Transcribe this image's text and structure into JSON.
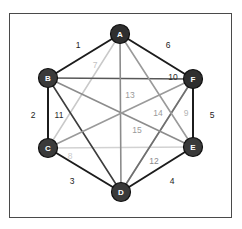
{
  "figure": {
    "title": "",
    "kind": "complete-graph-k6",
    "frame": {
      "stroke": "#4a4a4a",
      "background": "#ffffff"
    }
  },
  "nodes": [
    {
      "id": "A",
      "label": "A",
      "x": 120,
      "y": 34,
      "r": 9.5,
      "fill": "#2f2f2f",
      "text_color": "#ffffff"
    },
    {
      "id": "B",
      "label": "B",
      "x": 48,
      "y": 78,
      "r": 9.5,
      "fill": "#3a3a3a",
      "text_color": "#ffffff"
    },
    {
      "id": "C",
      "label": "C",
      "x": 48,
      "y": 148,
      "r": 9.5,
      "fill": "#3a3a3a",
      "text_color": "#ffffff"
    },
    {
      "id": "D",
      "label": "D",
      "x": 121,
      "y": 192,
      "r": 9.5,
      "fill": "#3a3a3a",
      "text_color": "#ffffff"
    },
    {
      "id": "E",
      "label": "E",
      "x": 193,
      "y": 147,
      "r": 9.5,
      "fill": "#3a3a3a",
      "text_color": "#ffffff"
    },
    {
      "id": "F",
      "label": "F",
      "x": 193,
      "y": 79,
      "r": 9.5,
      "fill": "#2f2f2f",
      "text_color": "#ffffff"
    }
  ],
  "edges": [
    {
      "label": "1",
      "from": "A",
      "to": "B",
      "color": "#1c1c1c",
      "width": 2.0,
      "label_x": 78,
      "label_y": 45,
      "label_color": "#222222"
    },
    {
      "label": "2",
      "from": "B",
      "to": "C",
      "color": "#1c1c1c",
      "width": 2.0,
      "label_x": 33,
      "label_y": 115,
      "label_color": "#222222"
    },
    {
      "label": "3",
      "from": "C",
      "to": "D",
      "color": "#1c1c1c",
      "width": 2.0,
      "label_x": 72,
      "label_y": 181,
      "label_color": "#222222"
    },
    {
      "label": "4",
      "from": "D",
      "to": "E",
      "color": "#1c1c1c",
      "width": 2.0,
      "label_x": 172,
      "label_y": 181,
      "label_color": "#222222"
    },
    {
      "label": "5",
      "from": "E",
      "to": "F",
      "color": "#1c1c1c",
      "width": 2.0,
      "label_x": 212,
      "label_y": 115,
      "label_color": "#222222"
    },
    {
      "label": "6",
      "from": "F",
      "to": "A",
      "color": "#1c1c1c",
      "width": 2.0,
      "label_x": 168,
      "label_y": 45,
      "label_color": "#222222"
    },
    {
      "label": "7",
      "from": "A",
      "to": "C",
      "color": "#c9c9c9",
      "width": 1.5,
      "label_x": 95,
      "label_y": 65,
      "label_color": "#c2c2c2"
    },
    {
      "label": "8",
      "from": "C",
      "to": "E",
      "color": "#d2d2d2",
      "width": 1.5,
      "label_x": 70,
      "label_y": 156,
      "label_color": "#cccccc"
    },
    {
      "label": "9",
      "from": "F",
      "to": "D",
      "color": "#b4b4b4",
      "width": 1.5,
      "label_x": 186,
      "label_y": 113,
      "label_color": "#b4b4b4"
    },
    {
      "label": "10",
      "from": "B",
      "to": "F",
      "color": "#585858",
      "width": 1.6,
      "label_x": 173,
      "label_y": 77,
      "label_color": "#2b2b2b"
    },
    {
      "label": "11",
      "from": "B",
      "to": "D",
      "color": "#3d3d3d",
      "width": 1.6,
      "label_x": 59,
      "label_y": 115,
      "label_color": "#2b2b2b"
    },
    {
      "label": "12",
      "from": "D",
      "to": "F",
      "color": "#6f6f6f",
      "width": 1.6,
      "label_x": 154,
      "label_y": 161,
      "label_color": "#8a8a8a"
    },
    {
      "label": "13",
      "from": "A",
      "to": "D",
      "color": "#8c8c8c",
      "width": 1.6,
      "label_x": 130,
      "label_y": 95,
      "label_color": "#9a9a9a"
    },
    {
      "label": "14",
      "from": "A",
      "to": "E",
      "color": "#9a9a9a",
      "width": 1.6,
      "label_x": 158,
      "label_y": 113,
      "label_color": "#9a9a9a"
    },
    {
      "label": "15",
      "from": "B",
      "to": "E",
      "color": "#8c8c8c",
      "width": 1.6,
      "label_x": 137,
      "label_y": 130,
      "label_color": "#9a9a9a"
    },
    {
      "label": "",
      "from": "C",
      "to": "F",
      "color": "#9a9a9a",
      "width": 1.6,
      "label_x": 0,
      "label_y": 0,
      "label_color": "#9a9a9a"
    }
  ]
}
